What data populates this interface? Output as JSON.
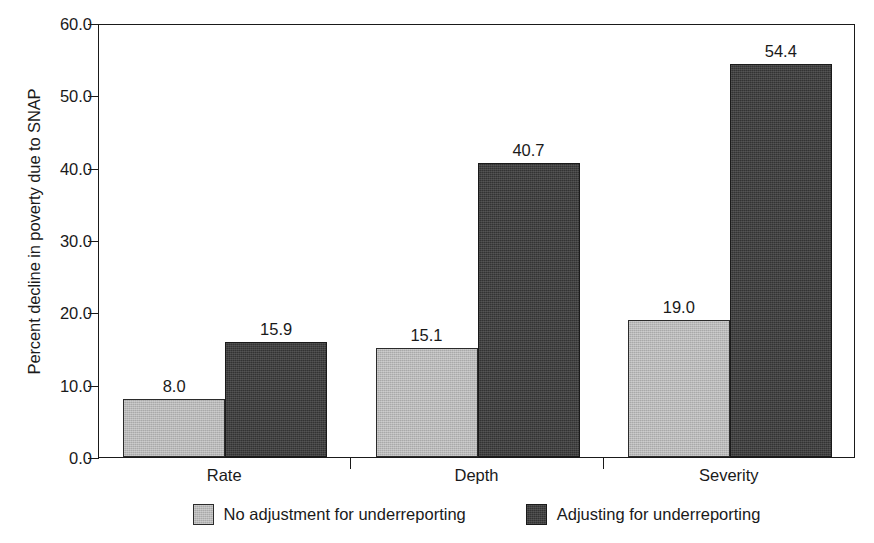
{
  "chart_data": {
    "type": "bar",
    "title": "",
    "xlabel": "",
    "ylabel": "Percent decline in poverty due to SNAP",
    "categories": [
      "Rate",
      "Depth",
      "Severity"
    ],
    "series": [
      {
        "name": "No adjustment for underreporting",
        "color": "#a9a9a9",
        "values": [
          8.0,
          15.1,
          19.0
        ],
        "labels": [
          "8.0",
          "15.1",
          "19.0"
        ]
      },
      {
        "name": "Adjusting for underreporting",
        "color": "#333333",
        "values": [
          15.9,
          40.7,
          54.4
        ],
        "labels": [
          "15.9",
          "40.7",
          "54.4"
        ]
      }
    ],
    "ylim": [
      0.0,
      60.0
    ],
    "ytick_step": 10.0,
    "ytick_labels": [
      "60.0",
      "50.0",
      "40.0",
      "30.0",
      "20.0",
      "10.0",
      "0.0"
    ],
    "ytick_values": [
      60.0,
      50.0,
      40.0,
      30.0,
      20.0,
      10.0,
      0.0
    ],
    "grid": false,
    "legend_position": "bottom"
  },
  "legend": {
    "items": [
      {
        "label": "No adjustment for underreporting",
        "swatch": "light"
      },
      {
        "label": "Adjusting for underreporting",
        "swatch": "dark"
      }
    ]
  }
}
